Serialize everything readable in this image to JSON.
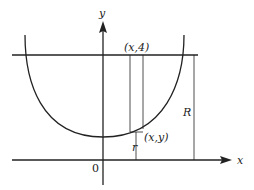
{
  "diagram": {
    "labels": {
      "y_axis": "y",
      "x_axis": "x",
      "origin": "0",
      "top_point": "(x,4)",
      "curve_point": "(x,y)",
      "small_radius": "r",
      "big_radius": "R"
    },
    "colors": {
      "stroke": "#222222",
      "background": "#ffffff"
    }
  }
}
